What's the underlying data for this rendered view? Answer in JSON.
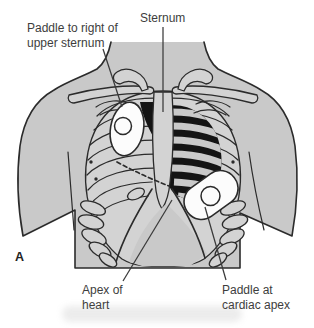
{
  "figure": {
    "panel_letter": "A",
    "labels": {
      "paddle_upper": {
        "line1": "Paddle to right of",
        "line2": "upper sternum"
      },
      "sternum": "Sternum",
      "apex": {
        "line1": "Apex of",
        "line2": "heart"
      },
      "paddle_apex": {
        "line1": "Paddle at",
        "line2": "cardiac apex"
      }
    },
    "colors": {
      "background": "#ffffff",
      "body_fill": "#c9c9c9",
      "bone_fill": "#d3d3d3",
      "heart_fill": "#141414",
      "outline": "#2b2b2b",
      "paddle_fill": "#fcfcfc",
      "leader": "#3a3a3a",
      "label_text": "#3d3d3d"
    }
  }
}
